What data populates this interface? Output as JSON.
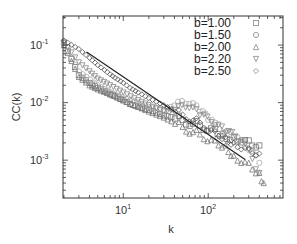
{
  "chart_data": {
    "type": "scatter",
    "title": "",
    "xlabel": "k",
    "ylabel": "CC(k)",
    "xscale": "log",
    "yscale": "log",
    "xlim": [
      1.95,
      760
    ],
    "ylim": [
      0.00022,
      0.32
    ],
    "x_ticks": [
      {
        "base": "10",
        "exp": "1",
        "value": 10
      },
      {
        "base": "10",
        "exp": "2",
        "value": 100
      }
    ],
    "y_ticks": [
      {
        "base": "10",
        "exp": "-1",
        "value": 0.1
      },
      {
        "base": "10",
        "exp": "-2",
        "value": 0.01
      },
      {
        "base": "10",
        "exp": "-3",
        "value": 0.001
      }
    ],
    "grid": false,
    "legend_position": "upper right",
    "series": [
      {
        "name": "b=1.00",
        "marker": "square",
        "color": "#777777",
        "points": [
          [
            2,
            0.11
          ],
          [
            3,
            0.03
          ],
          [
            4,
            0.022
          ],
          [
            5,
            0.018
          ],
          [
            6,
            0.016
          ],
          [
            7,
            0.014
          ],
          [
            8,
            0.013
          ],
          [
            10,
            0.011
          ],
          [
            12,
            0.0095
          ],
          [
            15,
            0.0085
          ],
          [
            20,
            0.0075
          ],
          [
            30,
            0.006
          ],
          [
            50,
            0.005
          ],
          [
            80,
            0.004
          ],
          [
            120,
            0.0035
          ],
          [
            150,
            0.0028
          ],
          [
            200,
            0.0025
          ],
          [
            300,
            0.0022
          ],
          [
            400,
            0.0018
          ]
        ]
      },
      {
        "name": "b=1.50",
        "marker": "circle",
        "color": "#aaaaaa",
        "points": [
          [
            2,
            0.1
          ],
          [
            3,
            0.035
          ],
          [
            5,
            0.02
          ],
          [
            8,
            0.014
          ],
          [
            12,
            0.011
          ],
          [
            20,
            0.0085
          ],
          [
            30,
            0.0075
          ],
          [
            40,
            0.009
          ],
          [
            60,
            0.0095
          ],
          [
            80,
            0.007
          ],
          [
            100,
            0.005
          ],
          [
            150,
            0.003
          ],
          [
            200,
            0.0025
          ],
          [
            300,
            0.0015
          ],
          [
            400,
            0.0009
          ]
        ]
      },
      {
        "name": "b=2.00",
        "marker": "triangle-up",
        "color": "#777777",
        "points": [
          [
            2,
            0.1
          ],
          [
            3,
            0.028
          ],
          [
            4,
            0.02
          ],
          [
            5,
            0.017
          ],
          [
            7,
            0.014
          ],
          [
            10,
            0.011
          ],
          [
            15,
            0.0085
          ],
          [
            20,
            0.007
          ],
          [
            30,
            0.0055
          ],
          [
            50,
            0.0038
          ],
          [
            80,
            0.0028
          ],
          [
            120,
            0.0022
          ],
          [
            160,
            0.0018
          ],
          [
            200,
            0.0012
          ],
          [
            300,
            0.0009
          ],
          [
            400,
            0.0006
          ],
          [
            450,
            0.0004
          ]
        ]
      },
      {
        "name": "b=2.20",
        "marker": "triangle-down",
        "color": "#888888",
        "points": [
          [
            2,
            0.11
          ],
          [
            3,
            0.05
          ],
          [
            4,
            0.035
          ],
          [
            5,
            0.026
          ],
          [
            7,
            0.02
          ],
          [
            10,
            0.015
          ],
          [
            15,
            0.011
          ],
          [
            20,
            0.009
          ],
          [
            30,
            0.007
          ],
          [
            40,
            0.0075
          ],
          [
            60,
            0.008
          ],
          [
            80,
            0.006
          ],
          [
            120,
            0.004
          ],
          [
            160,
            0.003
          ],
          [
            250,
            0.0022
          ],
          [
            400,
            0.0006
          ]
        ]
      },
      {
        "name": "b=2.50",
        "marker": "diamond",
        "color": "#555555",
        "points": [
          [
            2,
            0.12
          ],
          [
            3,
            0.085
          ],
          [
            4,
            0.06
          ],
          [
            5,
            0.045
          ],
          [
            6,
            0.037
          ],
          [
            7,
            0.031
          ],
          [
            8,
            0.027
          ],
          [
            10,
            0.022
          ],
          [
            12,
            0.018
          ],
          [
            15,
            0.015
          ],
          [
            20,
            0.012
          ],
          [
            30,
            0.009
          ],
          [
            50,
            0.0062
          ],
          [
            80,
            0.0045
          ],
          [
            120,
            0.0032
          ],
          [
            160,
            0.0025
          ],
          [
            200,
            0.002
          ],
          [
            300,
            0.0016
          ],
          [
            400,
            0.0013
          ]
        ]
      }
    ],
    "reference_line": {
      "label": "",
      "slope": -1,
      "points": [
        [
          3.7,
          0.076
        ],
        [
          272,
          0.00103
        ]
      ],
      "color": "#222222"
    }
  },
  "legend": {
    "items": [
      {
        "label": "b=1.00",
        "marker": "square"
      },
      {
        "label": "b=1.50",
        "marker": "circle"
      },
      {
        "label": "b=2.00",
        "marker": "triangle-up"
      },
      {
        "label": "b=2.20",
        "marker": "triangle-down"
      },
      {
        "label": "b=2.50",
        "marker": "diamond"
      }
    ]
  },
  "axes": {
    "x_title": "k",
    "y_title": "CC(k)",
    "x_ticks": [
      {
        "base": "10",
        "exp": "1"
      },
      {
        "base": "10",
        "exp": "2"
      }
    ],
    "y_ticks": [
      {
        "base": "10",
        "exp": "-1"
      },
      {
        "base": "10",
        "exp": "-2"
      },
      {
        "base": "10",
        "exp": "-3"
      }
    ]
  }
}
